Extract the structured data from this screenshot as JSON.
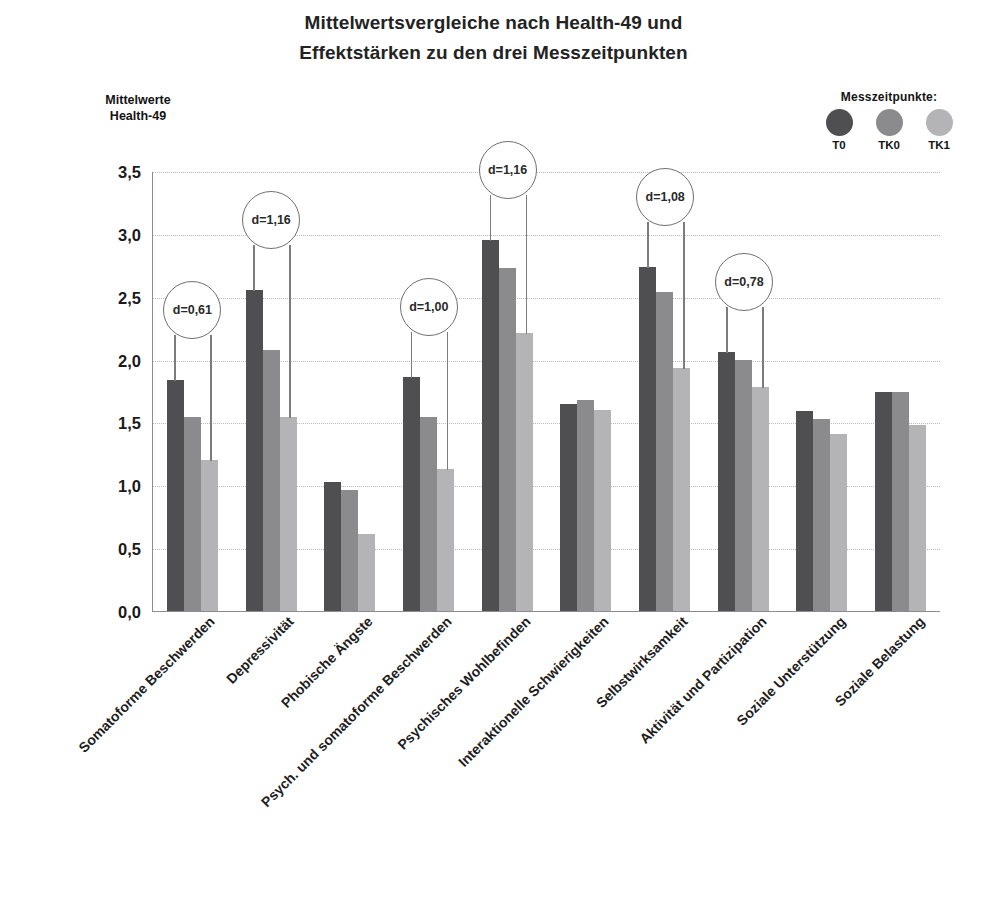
{
  "title": {
    "line1": "Mittelwertsvergleiche nach Health-49 und",
    "line2": "Effektstärken zu den drei Messzeitpunkten"
  },
  "axis_caption": {
    "line1": "Mittelwerte",
    "line2": "Health-49"
  },
  "legend": {
    "title": "Messzeitpunkte:",
    "items": [
      {
        "label": "T0",
        "color": "#4f4f52"
      },
      {
        "label": "TK0",
        "color": "#8b8b8e"
      },
      {
        "label": "TK1",
        "color": "#b4b4b6"
      }
    ]
  },
  "chart_data": {
    "type": "bar",
    "title": "Mittelwertsvergleiche nach Health-49 und Effektstärken zu den drei Messzeitpunkten",
    "xlabel": "",
    "ylabel": "Mittelwerte Health-49",
    "ylim": [
      0,
      3.5
    ],
    "yticks": [
      "0,0",
      "0,5",
      "1,0",
      "1,5",
      "2,0",
      "2,5",
      "3,0",
      "3,5"
    ],
    "ytick_values": [
      0,
      0.5,
      1.0,
      1.5,
      2.0,
      2.5,
      3.0,
      3.5
    ],
    "grid": true,
    "legend_position": "top-right",
    "categories": [
      "Somatoforme Beschwerden",
      "Depressivität",
      "Phobische Ängste",
      "Psych. und somatoforme Beschwerden",
      "Psychisches Wohlbefinden",
      "Interaktionelle Schwierigkeiten",
      "Selbstwirksamkeit",
      "Aktivität und Partizipation",
      "Soziale Unterstützung",
      "Soziale Belastung"
    ],
    "series": [
      {
        "name": "T0",
        "color": "#4f4f52",
        "values": [
          1.84,
          2.55,
          1.03,
          1.86,
          2.95,
          1.65,
          2.74,
          2.06,
          1.59,
          1.74
        ]
      },
      {
        "name": "TK0",
        "color": "#8b8b8e",
        "values": [
          1.54,
          2.08,
          0.96,
          1.54,
          2.73,
          1.68,
          2.54,
          2.0,
          1.53,
          1.74
        ]
      },
      {
        "name": "TK1",
        "color": "#b4b4b6",
        "values": [
          1.2,
          1.54,
          0.61,
          1.13,
          2.21,
          1.6,
          1.93,
          1.78,
          1.41,
          1.48
        ]
      }
    ],
    "annotations": [
      {
        "text": "d=0,61",
        "category_index": 0
      },
      {
        "text": "d=1,16",
        "category_index": 1
      },
      {
        "text": "d=1,00",
        "category_index": 3
      },
      {
        "text": "d=1,16",
        "category_index": 4
      },
      {
        "text": "d=1,08",
        "category_index": 6
      },
      {
        "text": "d=0,78",
        "category_index": 7
      }
    ]
  }
}
